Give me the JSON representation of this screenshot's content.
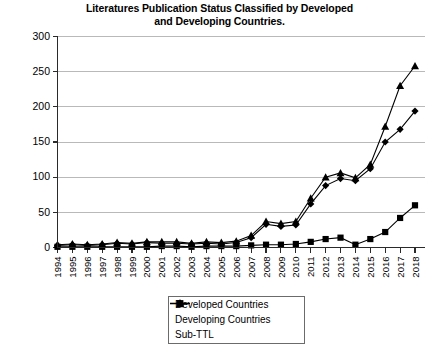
{
  "chart_data": {
    "type": "line",
    "title": "Literatures Publication Status Classified by Developed and Developing Countries.",
    "title_line1": "Literatures Publication Status Classified by Developed",
    "title_line2": "and Developing Countries.",
    "xlabel": "",
    "ylabel": "",
    "ylim": [
      0,
      300
    ],
    "yticks": [
      0,
      50,
      100,
      150,
      200,
      250,
      300
    ],
    "grid": true,
    "legend_position": "bottom-center",
    "categories": [
      "1994",
      "1995",
      "1996",
      "1997",
      "1998",
      "1999",
      "2000",
      "2001",
      "2002",
      "2003",
      "2004",
      "2005",
      "2006",
      "2007",
      "2008",
      "2009",
      "2010",
      "2011",
      "2012",
      "2013",
      "2014",
      "2015",
      "2016",
      "2017",
      "2018"
    ],
    "series": [
      {
        "name": "Developed Countries",
        "marker": "diamond",
        "values": [
          3,
          4,
          3,
          4,
          6,
          5,
          7,
          6,
          6,
          5,
          6,
          5,
          7,
          14,
          33,
          30,
          32,
          62,
          88,
          98,
          95,
          112,
          150,
          168,
          194
        ]
      },
      {
        "name": "Developing Countries",
        "marker": "square",
        "values": [
          1,
          1,
          1,
          1,
          1,
          1,
          1,
          2,
          2,
          1,
          2,
          2,
          2,
          3,
          4,
          4,
          5,
          8,
          12,
          14,
          4,
          12,
          22,
          42,
          60
        ]
      },
      {
        "name": "Sub-TTL",
        "marker": "triangle",
        "values": [
          4,
          5,
          4,
          5,
          7,
          6,
          8,
          8,
          8,
          6,
          8,
          7,
          9,
          17,
          37,
          34,
          37,
          70,
          100,
          106,
          99,
          118,
          172,
          230,
          258
        ]
      }
    ]
  },
  "legend": {
    "items": [
      {
        "label": "Developed Countries",
        "marker": "diamond"
      },
      {
        "label": "Developing Countries",
        "marker": "square"
      },
      {
        "label": "Sub-TTL",
        "marker": "triangle"
      }
    ]
  }
}
